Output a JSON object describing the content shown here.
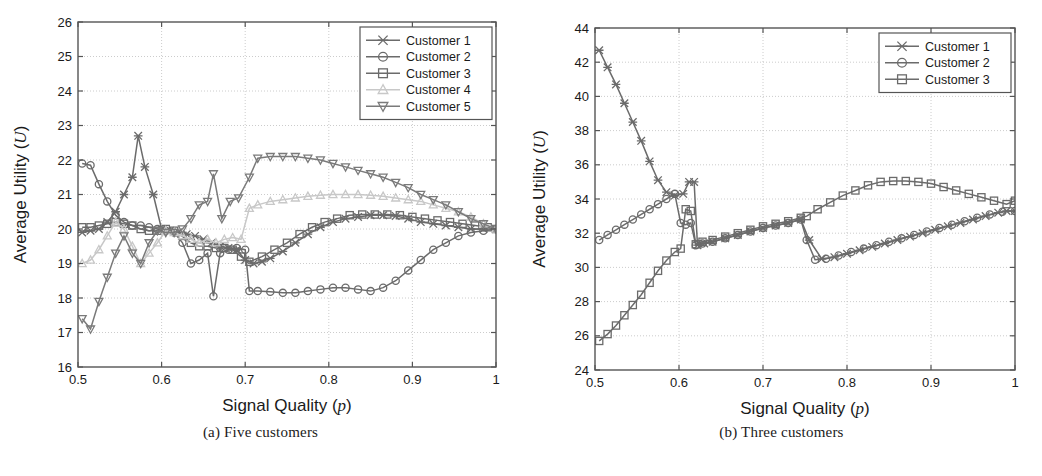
{
  "figure": {
    "panels": [
      {
        "id": "a",
        "caption": "(a)  Five customers",
        "xlabel_main": "Signal Quality (",
        "xlabel_italic": "p",
        "xlabel_close": ")",
        "ylabel_main": "Average Utility (",
        "ylabel_italic": "U",
        "ylabel_close": ")"
      },
      {
        "id": "b",
        "caption": "(b)  Three customers",
        "xlabel_main": "Signal Quality (",
        "xlabel_italic": "p",
        "xlabel_close": ")",
        "ylabel_main": "Average Utility (",
        "ylabel_italic": "U",
        "ylabel_close": ")"
      }
    ]
  },
  "chart_data": [
    {
      "type": "line",
      "panel": "a",
      "title": "(a)  Five customers",
      "xlabel": "Signal Quality (p)",
      "ylabel": "Average Utility (U)",
      "xlim": [
        0.5,
        1.0
      ],
      "ylim": [
        16,
        26
      ],
      "xticks": [
        0.5,
        0.6,
        0.7,
        0.8,
        0.9,
        1
      ],
      "xticklabels": [
        "0.5",
        "0.6",
        "0.7",
        "0.8",
        "0.9",
        "1"
      ],
      "yticks": [
        16,
        17,
        18,
        19,
        20,
        21,
        22,
        23,
        24,
        25,
        26
      ],
      "yticklabels": [
        "16",
        "17",
        "18",
        "19",
        "20",
        "21",
        "22",
        "23",
        "24",
        "25",
        "26"
      ],
      "grid": true,
      "legend_position": "top-right",
      "series": [
        {
          "name": "Customer 1",
          "marker": "x-cross",
          "color": "#6b6b6b",
          "x": [
            0.505,
            0.515,
            0.525,
            0.535,
            0.545,
            0.555,
            0.565,
            0.572,
            0.58,
            0.59,
            0.6,
            0.61,
            0.62,
            0.63,
            0.64,
            0.65,
            0.66,
            0.67,
            0.68,
            0.69,
            0.7,
            0.71,
            0.72,
            0.73,
            0.745,
            0.76,
            0.775,
            0.79,
            0.805,
            0.82,
            0.835,
            0.85,
            0.865,
            0.88,
            0.895,
            0.91,
            0.925,
            0.94,
            0.955,
            0.97,
            0.985,
            1.0
          ],
          "y": [
            19.9,
            19.95,
            20.0,
            20.2,
            20.5,
            21.0,
            21.5,
            22.7,
            21.8,
            21.0,
            20.0,
            19.95,
            19.9,
            19.85,
            19.8,
            19.7,
            19.6,
            19.5,
            19.45,
            19.4,
            19.1,
            19.0,
            19.05,
            19.15,
            19.35,
            19.6,
            19.85,
            20.05,
            20.2,
            20.3,
            20.35,
            20.4,
            20.4,
            20.38,
            20.3,
            20.2,
            20.15,
            20.1,
            20.05,
            20.0,
            20.0,
            20.0
          ]
        },
        {
          "name": "Customer 2",
          "marker": "circle",
          "color": "#6b6b6b",
          "x": [
            0.505,
            0.515,
            0.525,
            0.535,
            0.545,
            0.555,
            0.565,
            0.575,
            0.585,
            0.595,
            0.605,
            0.615,
            0.625,
            0.635,
            0.645,
            0.655,
            0.662,
            0.67,
            0.68,
            0.69,
            0.7,
            0.705,
            0.715,
            0.73,
            0.745,
            0.76,
            0.775,
            0.79,
            0.805,
            0.82,
            0.835,
            0.85,
            0.865,
            0.88,
            0.895,
            0.91,
            0.925,
            0.94,
            0.955,
            0.97,
            0.985,
            1.0
          ],
          "y": [
            21.9,
            21.85,
            21.3,
            20.8,
            20.4,
            20.2,
            20.1,
            20.1,
            20.05,
            20.0,
            19.95,
            19.9,
            19.6,
            19.0,
            19.1,
            19.3,
            18.05,
            19.3,
            19.4,
            19.45,
            19.4,
            18.2,
            18.2,
            18.18,
            18.15,
            18.15,
            18.2,
            18.25,
            18.3,
            18.3,
            18.25,
            18.2,
            18.3,
            18.5,
            18.8,
            19.1,
            19.4,
            19.6,
            19.8,
            19.9,
            19.95,
            20.0
          ]
        },
        {
          "name": "Customer 3",
          "marker": "square",
          "color": "#6b6b6b",
          "x": [
            0.505,
            0.515,
            0.525,
            0.535,
            0.545,
            0.555,
            0.565,
            0.575,
            0.585,
            0.595,
            0.605,
            0.615,
            0.625,
            0.635,
            0.645,
            0.655,
            0.665,
            0.675,
            0.685,
            0.695,
            0.705,
            0.72,
            0.735,
            0.75,
            0.765,
            0.78,
            0.795,
            0.81,
            0.825,
            0.84,
            0.855,
            0.87,
            0.885,
            0.9,
            0.915,
            0.93,
            0.945,
            0.96,
            0.975,
            0.99,
            1.0
          ],
          "y": [
            20.05,
            20.05,
            20.1,
            20.15,
            20.2,
            20.15,
            20.1,
            20.0,
            19.95,
            19.95,
            20.0,
            19.95,
            19.8,
            19.6,
            19.5,
            19.5,
            19.45,
            19.45,
            19.4,
            19.2,
            19.05,
            19.2,
            19.4,
            19.6,
            19.85,
            20.05,
            20.2,
            20.3,
            20.4,
            20.42,
            20.42,
            20.42,
            20.4,
            20.35,
            20.3,
            20.25,
            20.2,
            20.15,
            20.1,
            20.05,
            20.0
          ]
        },
        {
          "name": "Customer 4",
          "marker": "triangle-up",
          "color": "#c8c8c8",
          "x": [
            0.505,
            0.515,
            0.525,
            0.535,
            0.545,
            0.555,
            0.565,
            0.575,
            0.585,
            0.595,
            0.605,
            0.615,
            0.625,
            0.635,
            0.645,
            0.655,
            0.665,
            0.675,
            0.685,
            0.695,
            0.705,
            0.715,
            0.73,
            0.745,
            0.76,
            0.775,
            0.79,
            0.805,
            0.82,
            0.835,
            0.85,
            0.865,
            0.88,
            0.895,
            0.91,
            0.925,
            0.94,
            0.955,
            0.97,
            0.985,
            1.0
          ],
          "y": [
            19.0,
            19.1,
            19.4,
            19.8,
            20.2,
            20.0,
            19.5,
            19.0,
            19.3,
            19.6,
            19.95,
            19.9,
            19.8,
            19.7,
            19.6,
            19.7,
            19.6,
            19.7,
            19.75,
            19.7,
            20.6,
            20.7,
            20.8,
            20.85,
            20.9,
            20.95,
            20.98,
            21.0,
            21.0,
            21.0,
            20.98,
            20.95,
            20.9,
            20.85,
            20.8,
            20.7,
            20.6,
            20.5,
            20.35,
            20.15,
            20.0
          ]
        },
        {
          "name": "Customer 5",
          "marker": "triangle-down",
          "color": "#7a7a7a",
          "x": [
            0.505,
            0.515,
            0.525,
            0.535,
            0.545,
            0.555,
            0.565,
            0.575,
            0.585,
            0.595,
            0.605,
            0.615,
            0.625,
            0.635,
            0.645,
            0.655,
            0.662,
            0.672,
            0.682,
            0.692,
            0.705,
            0.715,
            0.73,
            0.745,
            0.76,
            0.775,
            0.79,
            0.805,
            0.82,
            0.835,
            0.85,
            0.865,
            0.88,
            0.895,
            0.91,
            0.925,
            0.94,
            0.955,
            0.97,
            0.985,
            1.0
          ],
          "y": [
            17.4,
            17.1,
            17.9,
            18.6,
            19.3,
            19.8,
            19.3,
            19.0,
            19.6,
            19.95,
            19.9,
            19.9,
            20.0,
            20.3,
            20.7,
            20.8,
            21.6,
            20.3,
            20.8,
            20.9,
            21.5,
            22.05,
            22.1,
            22.1,
            22.1,
            22.05,
            22.0,
            21.9,
            21.8,
            21.7,
            21.6,
            21.5,
            21.35,
            21.2,
            21.0,
            20.85,
            20.7,
            20.5,
            20.3,
            20.15,
            20.0
          ]
        }
      ]
    },
    {
      "type": "line",
      "panel": "b",
      "title": "(b)  Three customers",
      "xlabel": "Signal Quality (p)",
      "ylabel": "Average Utility (U)",
      "xlim": [
        0.5,
        1.0
      ],
      "ylim": [
        24,
        44
      ],
      "xticks": [
        0.5,
        0.6,
        0.7,
        0.8,
        0.9,
        1
      ],
      "xticklabels": [
        "0.5",
        "0.6",
        "0.7",
        "0.8",
        "0.9",
        "1"
      ],
      "yticks": [
        24,
        26,
        28,
        30,
        32,
        34,
        36,
        38,
        40,
        42,
        44
      ],
      "yticklabels": [
        "24",
        "26",
        "28",
        "30",
        "32",
        "34",
        "36",
        "38",
        "40",
        "42",
        "44"
      ],
      "grid": true,
      "legend_position": "top-right",
      "series": [
        {
          "name": "Customer 1",
          "marker": "x-cross",
          "color": "#6b6b6b",
          "x": [
            0.505,
            0.515,
            0.525,
            0.535,
            0.545,
            0.555,
            0.565,
            0.575,
            0.585,
            0.595,
            0.605,
            0.612,
            0.618,
            0.622,
            0.63,
            0.64,
            0.655,
            0.67,
            0.685,
            0.7,
            0.715,
            0.73,
            0.745,
            0.755,
            0.77,
            0.785,
            0.8,
            0.815,
            0.83,
            0.845,
            0.86,
            0.875,
            0.89,
            0.905,
            0.92,
            0.935,
            0.95,
            0.965,
            0.98,
            0.99,
            1.0
          ],
          "y": [
            42.7,
            41.7,
            40.7,
            39.6,
            38.5,
            37.4,
            36.2,
            35.1,
            34.4,
            34.2,
            34.3,
            35.0,
            35.0,
            31.3,
            31.4,
            31.5,
            31.7,
            31.9,
            32.1,
            32.3,
            32.45,
            32.6,
            32.8,
            31.6,
            30.5,
            30.6,
            30.8,
            31.0,
            31.2,
            31.4,
            31.6,
            31.8,
            32.0,
            32.2,
            32.4,
            32.6,
            32.8,
            33.0,
            33.2,
            33.3,
            33.3
          ]
        },
        {
          "name": "Customer 2",
          "marker": "circle",
          "color": "#6b6b6b",
          "x": [
            0.505,
            0.515,
            0.525,
            0.535,
            0.545,
            0.555,
            0.565,
            0.575,
            0.585,
            0.595,
            0.602,
            0.608,
            0.614,
            0.62,
            0.628,
            0.64,
            0.655,
            0.67,
            0.685,
            0.7,
            0.715,
            0.73,
            0.745,
            0.752,
            0.762,
            0.775,
            0.79,
            0.805,
            0.82,
            0.835,
            0.85,
            0.865,
            0.88,
            0.895,
            0.91,
            0.925,
            0.94,
            0.955,
            0.97,
            0.985,
            1.0
          ],
          "y": [
            31.6,
            31.9,
            32.2,
            32.5,
            32.8,
            33.1,
            33.4,
            33.7,
            34.0,
            34.3,
            32.6,
            32.5,
            32.6,
            31.3,
            31.4,
            31.5,
            31.7,
            31.9,
            32.1,
            32.3,
            32.45,
            32.6,
            32.8,
            31.6,
            30.45,
            30.5,
            30.7,
            30.9,
            31.1,
            31.3,
            31.5,
            31.7,
            31.9,
            32.1,
            32.3,
            32.5,
            32.7,
            32.9,
            33.1,
            33.25,
            33.3
          ]
        },
        {
          "name": "Customer 3",
          "marker": "square",
          "color": "#6b6b6b",
          "x": [
            0.505,
            0.515,
            0.525,
            0.535,
            0.545,
            0.555,
            0.565,
            0.575,
            0.585,
            0.595,
            0.602,
            0.608,
            0.614,
            0.62,
            0.628,
            0.64,
            0.655,
            0.67,
            0.685,
            0.7,
            0.715,
            0.73,
            0.745,
            0.752,
            0.765,
            0.78,
            0.795,
            0.81,
            0.825,
            0.84,
            0.855,
            0.87,
            0.885,
            0.9,
            0.915,
            0.93,
            0.945,
            0.96,
            0.975,
            0.99,
            1.0
          ],
          "y": [
            25.7,
            26.1,
            26.6,
            27.2,
            27.8,
            28.4,
            29.1,
            29.8,
            30.4,
            30.9,
            31.1,
            33.4,
            33.3,
            31.35,
            31.5,
            31.6,
            31.8,
            32.0,
            32.2,
            32.4,
            32.55,
            32.7,
            32.9,
            33.0,
            33.4,
            33.8,
            34.2,
            34.5,
            34.8,
            35.0,
            35.05,
            35.05,
            35.0,
            34.9,
            34.7,
            34.5,
            34.3,
            34.1,
            33.9,
            33.7,
            33.9
          ]
        }
      ]
    }
  ],
  "legends": {
    "panel_a": {
      "items": [
        {
          "label": "Customer 1",
          "marker": "x-cross",
          "color": "#6b6b6b"
        },
        {
          "label": "Customer 2",
          "marker": "circle",
          "color": "#6b6b6b"
        },
        {
          "label": "Customer 3",
          "marker": "square",
          "color": "#6b6b6b"
        },
        {
          "label": "Customer 4",
          "marker": "triangle-up",
          "color": "#c8c8c8"
        },
        {
          "label": "Customer 5",
          "marker": "triangle-down",
          "color": "#7a7a7a"
        }
      ]
    },
    "panel_b": {
      "items": [
        {
          "label": "Customer 1",
          "marker": "x-cross",
          "color": "#6b6b6b"
        },
        {
          "label": "Customer 2",
          "marker": "circle",
          "color": "#6b6b6b"
        },
        {
          "label": "Customer 3",
          "marker": "square",
          "color": "#6b6b6b"
        }
      ]
    }
  },
  "colors": {
    "axis": "#555555",
    "grid": "#bfbfbf",
    "text": "#1a1a1a",
    "background": "#ffffff"
  }
}
